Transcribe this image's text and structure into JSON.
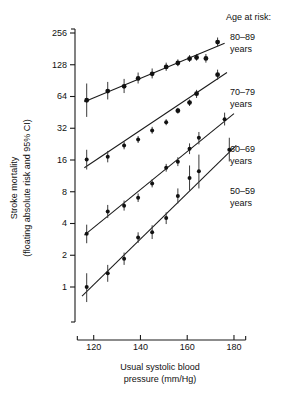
{
  "figure": {
    "title": "",
    "background": "#ffffff",
    "ink_color": "#111111"
  },
  "axes": {
    "y_title_line1": "Stroke mortality",
    "y_title_line2": "(floating absolute risk and 95% CI)",
    "x_title_line1": "Usual systolic blood",
    "x_title_line2": "pressure (mm/Hg)",
    "y_ticks": [
      "1",
      "2",
      "4",
      "8",
      "16",
      "32",
      "64",
      "128",
      "256"
    ],
    "x_ticks": [
      "120",
      "140",
      "160",
      "180"
    ]
  },
  "legend": {
    "heading": "Age at risk:",
    "entries": [
      {
        "range": "80–89",
        "unit": "years"
      },
      {
        "range": "70–79",
        "unit": "years"
      },
      {
        "range": "60–69",
        "unit": "years"
      },
      {
        "range": "50–59",
        "unit": "years"
      }
    ]
  },
  "chart_data": {
    "type": "scatter",
    "title": "",
    "xlabel": "Usual systolic blood pressure (mm/Hg)",
    "ylabel": "Stroke mortality (floating absolute risk and 95% CI)",
    "xlim": [
      112,
      186
    ],
    "ylim": [
      0.8,
      300
    ],
    "yscale": "log2",
    "y_tick_values": [
      1,
      2,
      4,
      8,
      16,
      32,
      64,
      128,
      256
    ],
    "x_tick_values": [
      120,
      140,
      160,
      180
    ],
    "grid": false,
    "legend_position": "right",
    "error_bars": "95% CI (floating absolute risk)",
    "series": [
      {
        "name": "80–89 years",
        "x": [
          117,
          126,
          133,
          139,
          145,
          151,
          156,
          161,
          164,
          168,
          173
        ],
        "y": [
          59,
          72,
          80,
          95,
          105,
          122,
          133,
          146,
          150,
          147,
          210
        ],
        "ci_low": [
          41,
          60,
          69,
          85,
          95,
          112,
          124,
          136,
          140,
          134,
          190
        ],
        "ci_high": [
          85,
          88,
          94,
          108,
          118,
          134,
          144,
          158,
          162,
          162,
          232
        ],
        "fit_line": {
          "x0": 116,
          "y0": 57,
          "x1": 176,
          "y1": 205
        }
      },
      {
        "name": "70–79 years",
        "x": [
          117,
          126,
          133,
          139,
          145,
          151,
          156,
          161,
          164,
          173
        ],
        "y": [
          16.2,
          17.2,
          22.0,
          25.0,
          30.5,
          36.5,
          47.0,
          56.0,
          68.0,
          103.0
        ],
        "ci_low": [
          13.0,
          15.2,
          20.2,
          23.2,
          28.4,
          34.2,
          44.0,
          52.0,
          62.0,
          92.0
        ],
        "ci_high": [
          20.0,
          19.5,
          24.0,
          27.0,
          33.0,
          39.0,
          50.0,
          60.0,
          74.0,
          115.0
        ],
        "fit_line": {
          "x0": 116,
          "y0": 13.5,
          "x1": 177,
          "y1": 108
        }
      },
      {
        "name": "60–69 years",
        "x": [
          117,
          126,
          133,
          139,
          145,
          151,
          156,
          161,
          165,
          176
        ],
        "y": [
          3.2,
          5.2,
          5.9,
          7.0,
          9.6,
          13.5,
          15.4,
          20.5,
          26.0,
          39.0
        ],
        "ci_low": [
          2.6,
          4.5,
          5.3,
          6.4,
          8.8,
          12.4,
          14.0,
          18.2,
          22.5,
          34.0
        ],
        "ci_high": [
          3.9,
          6.0,
          6.6,
          7.7,
          10.5,
          14.7,
          17.0,
          23.0,
          29.5,
          45.0
        ],
        "fit_line": {
          "x0": 116,
          "y0": 3.1,
          "x1": 180,
          "y1": 44
        }
      },
      {
        "name": "50–59 years",
        "x": [
          117,
          126,
          133,
          139,
          145,
          151,
          156,
          161,
          165,
          178
        ],
        "y": [
          1.0,
          1.35,
          1.85,
          2.95,
          3.3,
          4.5,
          7.3,
          10.8,
          12.5,
          20.0
        ],
        "ci_low": [
          0.72,
          1.12,
          1.62,
          2.62,
          2.85,
          3.95,
          6.2,
          8.2,
          8.6,
          15.5
        ],
        "ci_high": [
          1.35,
          1.62,
          2.12,
          3.3,
          3.85,
          5.1,
          8.6,
          14.2,
          18.0,
          26.0
        ],
        "fit_line": {
          "x0": 115,
          "y0": 0.82,
          "x1": 181,
          "y1": 22
        }
      }
    ]
  }
}
